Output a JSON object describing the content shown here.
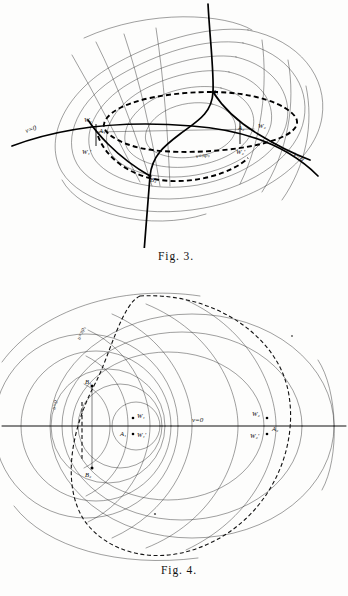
{
  "page": {
    "background_color": "#fdfdfc",
    "ink_color": "#111111",
    "kind": "scanned-mathematics-figure-plate"
  },
  "figures": [
    {
      "id": "figure-3",
      "caption": "Fig. 3.",
      "description": "Oblique view of a family of confocal-like curvilinear coordinate ovals with a heavy S-shaped curve and a heavy dash-dot closed oval overlaid.",
      "labels": [
        {
          "name": "v-equals-zero-left",
          "text": "v=0",
          "x": 26,
          "y": 133,
          "rotate": -17
        },
        {
          "name": "v-equals-zero-right",
          "text": "v=0",
          "x": 293,
          "y": 155,
          "rotate": 38
        },
        {
          "name": "v-equals-pi-rho",
          "text": "v=πρ₀",
          "x": 196,
          "y": 158,
          "rotate": -8
        },
        {
          "name": "point-w1",
          "text": "W₁",
          "x": 88,
          "y": 124
        },
        {
          "name": "point-a1",
          "text": "A₁",
          "x": 100,
          "y": 133
        },
        {
          "name": "point-w1-prime",
          "text": "W₁'",
          "x": 86,
          "y": 151
        },
        {
          "name": "point-a2",
          "text": "A₂",
          "x": 243,
          "y": 132
        },
        {
          "name": "point-w2",
          "text": "W₂",
          "x": 261,
          "y": 130
        },
        {
          "name": "point-w2-prime",
          "text": "W₂'",
          "x": 240,
          "y": 152
        },
        {
          "name": "point-b1",
          "text": "B₁",
          "x": 211,
          "y": 88
        },
        {
          "name": "point-b2",
          "text": "B₂",
          "x": 152,
          "y": 179
        }
      ]
    },
    {
      "id": "figure-4",
      "caption": "Fig. 4.",
      "description": "Plan view of nested bipolar coordinate circles crossed by orthogonal arcs, with a large dashed oval and a horizontal axis.",
      "labels": [
        {
          "name": "u-equals-pi-rho",
          "text": "u=πρ₀",
          "x": 80,
          "y": 338,
          "rotate": -68
        },
        {
          "name": "u-equals-zero",
          "text": "u=0",
          "x": 55,
          "y": 408,
          "rotate": -72
        },
        {
          "name": "v-equals-zero",
          "text": "v=0",
          "x": 192,
          "y": 426
        },
        {
          "name": "point-b1",
          "text": "B₁",
          "x": 86,
          "y": 383
        },
        {
          "name": "point-b2",
          "text": "B₂",
          "x": 87,
          "y": 477
        },
        {
          "name": "point-w1",
          "text": "W₁",
          "x": 137,
          "y": 420
        },
        {
          "name": "point-a1",
          "text": "A₁",
          "x": 127,
          "y": 437
        },
        {
          "name": "point-w1-prime",
          "text": "W₁'",
          "x": 138,
          "y": 441
        },
        {
          "name": "point-w2",
          "text": "W₂",
          "x": 260,
          "y": 419
        },
        {
          "name": "point-a2",
          "text": "A₂",
          "x": 275,
          "y": 433
        },
        {
          "name": "point-w2-prime",
          "text": "W₂'",
          "x": 259,
          "y": 441
        }
      ]
    }
  ]
}
